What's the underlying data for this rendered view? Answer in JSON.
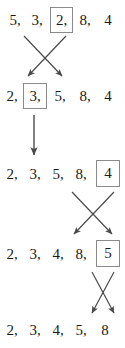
{
  "diagram": {
    "type": "sorting-swap-trace",
    "rows": [
      {
        "id": "row-1",
        "values": [
          "5,",
          "3,",
          "2,",
          "8,",
          "4"
        ],
        "boxed_index": 2
      },
      {
        "id": "row-2",
        "values": [
          "2,",
          "3,",
          "5,",
          "8,",
          "4"
        ],
        "boxed_index": 1
      },
      {
        "id": "row-3",
        "values": [
          "2,",
          "3,",
          "5,",
          "8,",
          "4"
        ],
        "boxed_index": 4
      },
      {
        "id": "row-4",
        "values": [
          "2,",
          "3,",
          "4,",
          "8,",
          "5"
        ],
        "boxed_index": 4
      },
      {
        "id": "row-5",
        "values": [
          "2,",
          "3,",
          "4,",
          "5,",
          "8"
        ],
        "boxed_index": -1
      }
    ],
    "connectors": [
      {
        "id": "connector-1",
        "kind": "cross-swap",
        "between_rows": [
          1,
          2
        ],
        "label": "swap"
      },
      {
        "id": "connector-2",
        "kind": "down-arrow",
        "between_rows": [
          2,
          3
        ],
        "label": "carry down"
      },
      {
        "id": "connector-3",
        "kind": "cross-swap",
        "between_rows": [
          3,
          4
        ],
        "label": "swap"
      },
      {
        "id": "connector-4",
        "kind": "cross-swap",
        "between_rows": [
          4,
          5
        ],
        "label": "swap"
      }
    ],
    "colors": {
      "text": "#1b1b1b",
      "box_border": "#8a8a8a",
      "arrow": "#4a4a4a",
      "background": "#ffffff"
    }
  }
}
